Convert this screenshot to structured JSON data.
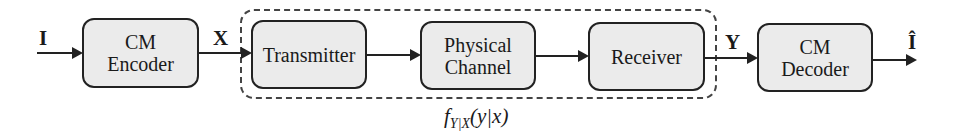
{
  "diagram": {
    "type": "block-diagram",
    "blocks": [
      {
        "id": "cm-encoder",
        "lines": [
          "CM",
          "Encoder"
        ]
      },
      {
        "id": "transmitter",
        "lines": [
          "Transmitter"
        ]
      },
      {
        "id": "physical-channel",
        "lines": [
          "Physical",
          "Channel"
        ]
      },
      {
        "id": "receiver",
        "lines": [
          "Receiver"
        ]
      },
      {
        "id": "cm-decoder",
        "lines": [
          "CM",
          "Decoder"
        ]
      }
    ],
    "signals": {
      "input": "I",
      "encoded": "X",
      "received": "Y",
      "output": "Î"
    },
    "group": {
      "label_f": "f",
      "label_sub": "Y|X",
      "label_args": "(y|x)",
      "contains": [
        "transmitter",
        "physical-channel",
        "receiver"
      ]
    },
    "colors": {
      "block_fill": "#ebebeb",
      "stroke": "#222222"
    }
  }
}
